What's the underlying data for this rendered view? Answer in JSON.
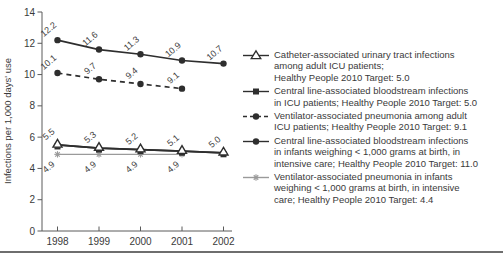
{
  "chart_data": {
    "type": "line",
    "title": "",
    "xlabel": "",
    "ylabel": "Infections per 1,000 days' use",
    "x_ticks": [
      1998,
      1999,
      2000,
      2001,
      2002
    ],
    "y_ticks": [
      0,
      2,
      4,
      6,
      8,
      10,
      12,
      14
    ],
    "ylim": [
      0,
      14
    ],
    "grid": false,
    "legend_position": "right",
    "label_color": "#3f3f3f",
    "axis_color": "#5a5a5a",
    "series": [
      {
        "id": "catheter-uti-adult-icu",
        "name": "Catheter-associated urinary tract infections among adult ICU patients",
        "target": "Healthy People 2010 Target: 5.0",
        "marker": "open-triangle",
        "line_style": "solid",
        "color": "#2e2e2e",
        "x": [
          1998,
          1999,
          2000,
          2001,
          2002
        ],
        "values": [
          5.5,
          5.3,
          5.2,
          5.1,
          5.0
        ],
        "labels_shown": true,
        "label_side": "above",
        "draw_order": 4
      },
      {
        "id": "clabsi-icu",
        "name": "Central line-associated bloodstream infections in ICU patients",
        "target": "Healthy People 2010 Target: 5.0",
        "marker": "filled-square",
        "line_style": "solid",
        "color": "#2e2e2e",
        "x": [
          1998,
          1999,
          2000,
          2001,
          2002
        ],
        "values": [
          5.5,
          5.3,
          5.2,
          5.1,
          5.0
        ],
        "labels_shown": false,
        "label_side": "above",
        "draw_order": 1
      },
      {
        "id": "vap-adult-icu",
        "name": "Ventilator-associated pneumonia among adult ICU patients",
        "target": "Healthy People 2010 Target: 9.1",
        "marker": "filled-circle",
        "line_style": "dashed",
        "color": "#2e2e2e",
        "x": [
          1998,
          1999,
          2000,
          2001
        ],
        "values": [
          10.1,
          9.7,
          9.4,
          9.1
        ],
        "labels_shown": true,
        "label_side": "above",
        "draw_order": 2
      },
      {
        "id": "clabsi-infants",
        "name": "Central line-associated bloodstream infections in infants weighing < 1,000 grams at birth, in intensive care",
        "target": "Healthy People 2010 Target: 11.0",
        "marker": "filled-circle",
        "line_style": "solid",
        "color": "#2e2e2e",
        "x": [
          1998,
          1999,
          2000,
          2001,
          2002
        ],
        "values": [
          12.2,
          11.6,
          11.3,
          10.9,
          10.7
        ],
        "labels_shown": true,
        "label_side": "above",
        "draw_order": 3
      },
      {
        "id": "vap-infants",
        "name": "Ventilator-associated pneumonia in infants weighing < 1,000 grams at birth, in intensive care",
        "target": "Healthy People 2010 Target: 4.4",
        "marker": "gray-star",
        "line_style": "solid",
        "color": "#9a9a9a",
        "x": [
          1998,
          1999,
          2000,
          2001
        ],
        "values": [
          4.9,
          4.9,
          4.9,
          4.9
        ],
        "labels_shown": true,
        "label_side": "below",
        "draw_order": 0
      }
    ]
  },
  "legend": {
    "entries": [
      {
        "marker": "open-triangle",
        "lines": [
          "Catheter-associated urinary tract infections",
          "among adult ICU patients;",
          "Healthy People 2010 Target: 5.0"
        ]
      },
      {
        "marker": "filled-square",
        "lines": [
          "Central line-associated bloodstream infections",
          "in ICU patients; Healthy People 2010 Target: 5.0"
        ]
      },
      {
        "marker": "dashed-circle",
        "lines": [
          "Ventilator-associated pneumonia among adult",
          "ICU patients; Healthy People 2010 Target: 9.1"
        ]
      },
      {
        "marker": "filled-circle",
        "lines": [
          "Central line-associated bloodstream infections",
          "in infants weighing < 1,000 grams at birth, in",
          "intensive care; Healthy People 2010 Target: 11.0"
        ]
      },
      {
        "marker": "gray-star",
        "lines": [
          "Ventilator-associated pneumonia in infants",
          "weighing < 1,000 grams at birth, in intensive",
          "care; Healthy People 2010 Target: 4.4"
        ]
      }
    ]
  }
}
